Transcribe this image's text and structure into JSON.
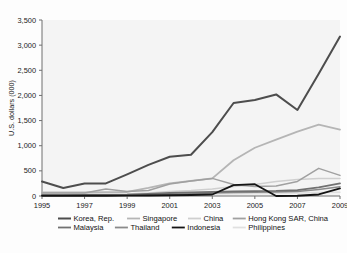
{
  "chart_data": {
    "type": "line",
    "title": "",
    "xlabel": "",
    "ylabel": "U.S. dollars (000)",
    "xlim": [
      1995,
      2009
    ],
    "ylim": [
      0,
      3500
    ],
    "grid": false,
    "legend_position": "bottom",
    "x": [
      1995,
      1996,
      1997,
      1998,
      1999,
      2000,
      2001,
      2002,
      2003,
      2004,
      2005,
      2006,
      2007,
      2008,
      2009
    ],
    "ytick_labels": [
      "0",
      "500",
      "1,000",
      "1,500",
      "2,000",
      "2,500",
      "3,000",
      "3,500"
    ],
    "ytick_values": [
      0,
      500,
      1000,
      1500,
      2000,
      2500,
      3000,
      3500
    ],
    "xtick_labels": [
      "1995",
      "1997",
      "1999",
      "2001",
      "2003",
      "2005",
      "2007",
      "2009"
    ],
    "xtick_values": [
      1995,
      1997,
      1999,
      2001,
      2003,
      2005,
      2007,
      2009
    ],
    "series": [
      {
        "name": "Korea, Rep.",
        "color": "#4d4d4d",
        "width": 2.0,
        "values": [
          290,
          160,
          250,
          250,
          430,
          620,
          780,
          820,
          1270,
          1850,
          1910,
          2020,
          1710,
          2430,
          3170
        ]
      },
      {
        "name": "Singapore",
        "color": "#b5b5b5",
        "width": 1.8,
        "values": [
          70,
          70,
          70,
          75,
          80,
          160,
          250,
          300,
          350,
          710,
          960,
          1120,
          1280,
          1420,
          1320
        ]
      },
      {
        "name": "China",
        "color": "#cfcfcf",
        "width": 1.5,
        "values": [
          20,
          25,
          30,
          30,
          40,
          60,
          90,
          110,
          140,
          190,
          230,
          290,
          330,
          350,
          350
        ]
      },
      {
        "name": "Hong Kong SAR, China",
        "color": "#a0a0a0",
        "width": 1.5,
        "values": [
          60,
          60,
          60,
          140,
          90,
          110,
          240,
          300,
          350,
          230,
          190,
          200,
          290,
          550,
          410
        ]
      },
      {
        "name": "Malaysia",
        "color": "#717171",
        "width": 1.8,
        "values": [
          15,
          15,
          20,
          20,
          25,
          40,
          60,
          70,
          80,
          90,
          95,
          100,
          115,
          170,
          250
        ]
      },
      {
        "name": "Thailand",
        "color": "#8a8a8a",
        "width": 1.6,
        "values": [
          10,
          10,
          12,
          12,
          15,
          20,
          30,
          45,
          60,
          70,
          75,
          80,
          90,
          130,
          185
        ]
      },
      {
        "name": "Indonesia",
        "color": "#141414",
        "width": 1.8,
        "values": [
          5,
          5,
          5,
          5,
          8,
          10,
          15,
          20,
          30,
          215,
          235,
          0,
          5,
          30,
          150
        ]
      },
      {
        "name": "Philippines",
        "color": "#e0e0e0",
        "width": 1.5,
        "values": [
          5,
          5,
          8,
          8,
          10,
          15,
          25,
          30,
          40,
          45,
          50,
          55,
          60,
          70,
          75
        ]
      }
    ]
  },
  "axis": {
    "y_label": "U.S. dollars (000)"
  },
  "legend": {
    "row1": [
      {
        "label": "Korea, Rep.",
        "color": "#4d4d4d",
        "width": 2.0
      },
      {
        "label": "Singapore",
        "color": "#b5b5b5",
        "width": 1.8
      },
      {
        "label": "China",
        "color": "#cfcfcf",
        "width": 1.5
      },
      {
        "label": "Hong Kong SAR, China",
        "color": "#a0a0a0",
        "width": 1.5
      }
    ],
    "row2": [
      {
        "label": "Malaysia",
        "color": "#717171",
        "width": 1.8
      },
      {
        "label": "Thailand",
        "color": "#8a8a8a",
        "width": 1.6
      },
      {
        "label": "Indonesia",
        "color": "#141414",
        "width": 1.8
      },
      {
        "label": "Philippines",
        "color": "#e0e0e0",
        "width": 1.5
      }
    ]
  },
  "style": {
    "plot_background": "#f4f4f4",
    "axis_color": "#6f6f6f",
    "text_color": "#1a1a1a",
    "figure_background": "#fdfdfd"
  }
}
